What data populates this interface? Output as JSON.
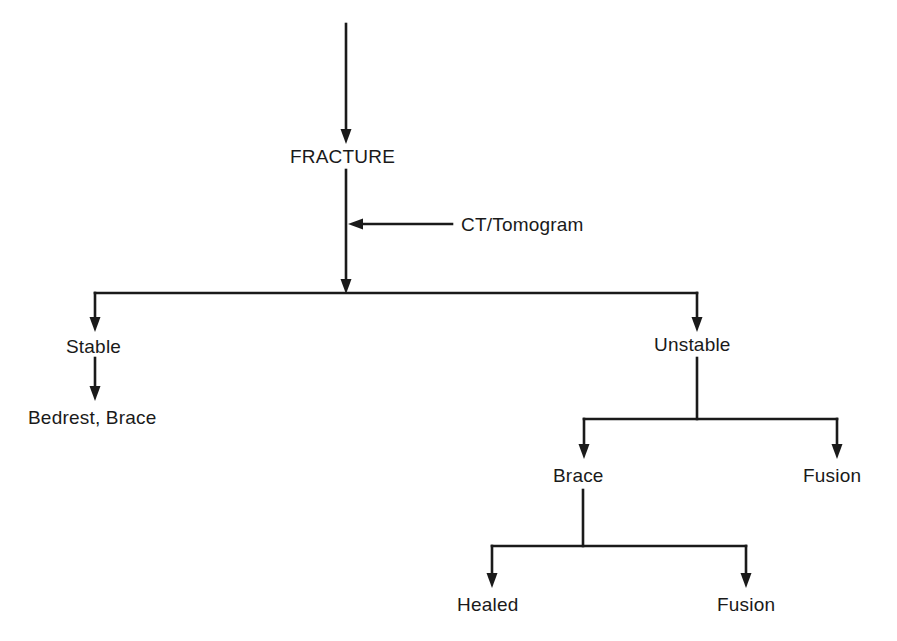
{
  "diagram": {
    "type": "flowchart",
    "line_color": "#1a1a1a",
    "background": "#ffffff",
    "nodes": {
      "fracture": {
        "label": "FRACTURE"
      },
      "ct_tomogram": {
        "label": "CT/Tomogram"
      },
      "stable": {
        "label": "Stable"
      },
      "bedrest_brace": {
        "label": "Bedrest, Brace"
      },
      "unstable": {
        "label": "Unstable"
      },
      "brace": {
        "label": "Brace"
      },
      "fusion_1": {
        "label": "Fusion"
      },
      "healed": {
        "label": "Healed"
      },
      "fusion_2": {
        "label": "Fusion"
      }
    },
    "edges": [
      {
        "from": "entry",
        "to": "fracture"
      },
      {
        "from": "ct_tomogram",
        "to": "fracture-stem"
      },
      {
        "from": "fracture",
        "to": "stable"
      },
      {
        "from": "fracture",
        "to": "unstable"
      },
      {
        "from": "stable",
        "to": "bedrest_brace"
      },
      {
        "from": "unstable",
        "to": "brace"
      },
      {
        "from": "unstable",
        "to": "fusion_1"
      },
      {
        "from": "brace",
        "to": "healed"
      },
      {
        "from": "brace",
        "to": "fusion_2"
      }
    ]
  }
}
